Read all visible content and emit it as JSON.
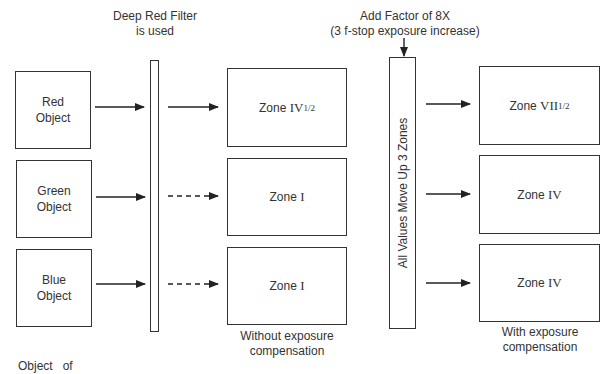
{
  "filter": {
    "label_line1": "Deep Red Filter",
    "label_line2": "is used"
  },
  "factor": {
    "label_line1": "Add Factor of 8X",
    "label_line2": "(3 f-stop exposure increase)"
  },
  "shift_bar": {
    "label": "All Values Move Up 3 Zones"
  },
  "objects": [
    {
      "line1": "Red",
      "line2": "Object"
    },
    {
      "line1": "Green",
      "line2": "Object"
    },
    {
      "line1": "Blue",
      "line2": "Object"
    }
  ],
  "without_compensation": {
    "zones": [
      {
        "prefix": "Zone ",
        "roman": "IV",
        "frac": "1/2"
      },
      {
        "prefix": "Zone ",
        "roman": "I",
        "frac": ""
      },
      {
        "prefix": "Zone ",
        "roman": "I",
        "frac": ""
      }
    ],
    "caption_line1": "Without exposure",
    "caption_line2": "compensation"
  },
  "with_compensation": {
    "zones": [
      {
        "prefix": "Zone ",
        "roman": "VII",
        "frac": "1/2"
      },
      {
        "prefix": "Zone ",
        "roman": "IV",
        "frac": ""
      },
      {
        "prefix": "Zone ",
        "roman": "IV",
        "frac": ""
      }
    ],
    "caption_line1": "With exposure",
    "caption_line2": "compensation"
  },
  "footer": {
    "partial_text": "Object   of"
  },
  "colors": {
    "stroke": "#333333",
    "background": "#ffffff"
  }
}
